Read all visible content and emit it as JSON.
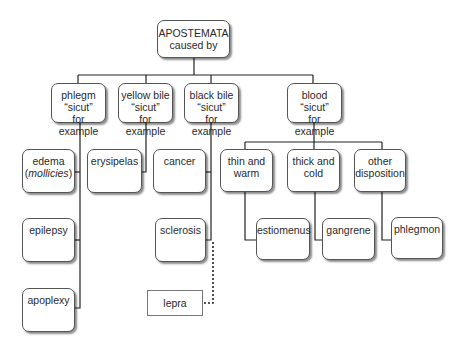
{
  "root": {
    "line1": "APOSTEMATA",
    "line2": "caused by"
  },
  "causes": [
    {
      "name": "phlegm",
      "sicut": "“sicut”",
      "example": "for example"
    },
    {
      "name": "yellow bile",
      "sicut": "“sicut”",
      "example": "for example"
    },
    {
      "name": "black bile",
      "sicut": "“sicut”",
      "example": "for example"
    },
    {
      "name": "blood",
      "sicut": "“sicut”",
      "example": "for example"
    }
  ],
  "phlegm_examples": [
    {
      "label": "edema",
      "sublabel": "mollicies"
    },
    {
      "label": "epilepsy"
    },
    {
      "label": "apoplexy"
    }
  ],
  "yellow_bile_examples": [
    {
      "label": "erysipelas"
    }
  ],
  "black_bile_examples": [
    {
      "label": "cancer"
    },
    {
      "label": "sclerosis"
    }
  ],
  "black_bile_dotted": {
    "label": "lepra"
  },
  "blood_dispositions": [
    {
      "line1": "thin and",
      "line2": "warm",
      "result": "estiomenus"
    },
    {
      "line1": "thick and",
      "line2": "cold",
      "result": "gangrene"
    },
    {
      "line1": "other",
      "line2": "disposition",
      "result": "phlegmon"
    }
  ]
}
